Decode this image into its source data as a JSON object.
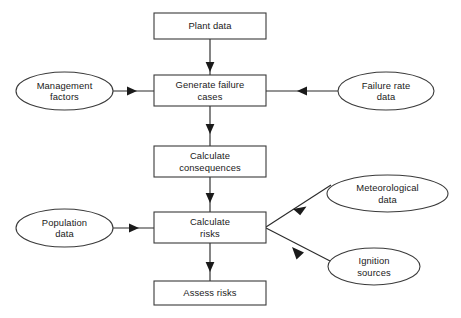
{
  "diagram": {
    "type": "flowchart",
    "canvas": {
      "width": 461,
      "height": 318
    },
    "style": {
      "background": "#ffffff",
      "stroke": "#3a3a3a",
      "edge_stroke": "#2b2b2b",
      "text": "#1a1a1a",
      "fill": "#ffffff"
    },
    "process_nodes": [
      {
        "id": "plant-data",
        "label": "Plant data",
        "shape": "rectangle",
        "x": 154,
        "y": 13,
        "w": 112,
        "h": 26
      },
      {
        "id": "generate-failure-cases",
        "label": "Generate failure\ncases",
        "shape": "rectangle",
        "x": 154,
        "y": 75,
        "w": 112,
        "h": 31
      },
      {
        "id": "calculate-consequences",
        "label": "Calculate\nconsequences",
        "shape": "rectangle",
        "x": 154,
        "y": 146,
        "w": 112,
        "h": 31
      },
      {
        "id": "calculate-risks",
        "label": "Calculate\nrisks",
        "shape": "rectangle",
        "x": 154,
        "y": 212,
        "w": 112,
        "h": 31
      },
      {
        "id": "assess-risks",
        "label": "Assess risks",
        "shape": "rectangle",
        "x": 154,
        "y": 281,
        "w": 112,
        "h": 24
      }
    ],
    "data_nodes": [
      {
        "id": "management-factors",
        "label": "Management\nfactors",
        "shape": "ellipse",
        "cx": 64.5,
        "cy": 91,
        "rx": 48.5,
        "ry": 19
      },
      {
        "id": "failure-rate-data",
        "label": "Failure rate\ndata",
        "shape": "ellipse",
        "cx": 386,
        "cy": 91,
        "rx": 48,
        "ry": 19
      },
      {
        "id": "meteorological-data",
        "label": "Meteorological\ndata",
        "shape": "ellipse",
        "cx": 387.5,
        "cy": 193.5,
        "rx": 60.5,
        "ry": 18.5
      },
      {
        "id": "population-data",
        "label": "Population\ndata",
        "shape": "ellipse",
        "cx": 64.5,
        "cy": 228,
        "rx": 48.5,
        "ry": 19
      },
      {
        "id": "ignition-sources",
        "label": "Ignition\nsources",
        "shape": "ellipse",
        "cx": 374,
        "cy": 266.5,
        "rx": 46,
        "ry": 18.5
      }
    ],
    "edges": [
      {
        "id": "e-plant-to-generate",
        "from": "plant-data",
        "to": "generate-failure-cases",
        "direction": "down",
        "arrow": "end"
      },
      {
        "id": "e-management-to-generate",
        "from": "management-factors",
        "to": "generate-failure-cases",
        "direction": "right",
        "arrow": "end"
      },
      {
        "id": "e-failurerate-to-generate",
        "from": "failure-rate-data",
        "to": "generate-failure-cases",
        "direction": "left",
        "arrow": "end"
      },
      {
        "id": "e-generate-to-consequences",
        "from": "generate-failure-cases",
        "to": "calculate-consequences",
        "direction": "down",
        "arrow": "end"
      },
      {
        "id": "e-consequences-to-risks",
        "from": "calculate-consequences",
        "to": "calculate-risks",
        "direction": "down",
        "arrow": "end"
      },
      {
        "id": "e-population-to-risks",
        "from": "population-data",
        "to": "calculate-risks",
        "direction": "right",
        "arrow": "end"
      },
      {
        "id": "e-meteorological-to-risks",
        "from": "meteorological-data",
        "to": "calculate-risks",
        "direction": "diagonal-down-left",
        "arrow": "end"
      },
      {
        "id": "e-ignition-to-risks",
        "from": "ignition-sources",
        "to": "calculate-risks",
        "direction": "diagonal-up-left",
        "arrow": "end"
      },
      {
        "id": "e-risks-to-assess",
        "from": "calculate-risks",
        "to": "assess-risks",
        "direction": "down",
        "arrow": "end"
      }
    ]
  }
}
